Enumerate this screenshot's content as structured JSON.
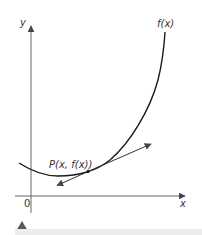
{
  "figure": {
    "type": "tangent-line-diagram",
    "axes": {
      "x_label": "x",
      "y_label": "y",
      "origin_label": "0"
    },
    "curve_label": "f(x)",
    "point_label": "P(x, f(x))",
    "colors": {
      "axis": "#555555",
      "curve": "#1a1a1a",
      "tangent": "#333333",
      "marker": "#5a5a5a",
      "band": "#ececec"
    }
  }
}
